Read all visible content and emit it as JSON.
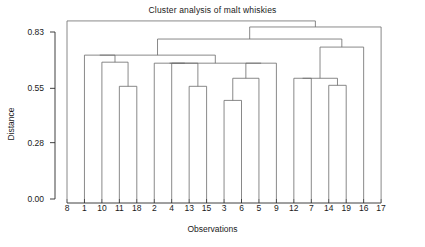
{
  "chart_data": {
    "type": "dendrogram",
    "title": "Cluster analysis of malt whiskies",
    "xlabel": "Observations",
    "ylabel": "Distance",
    "ylim": [
      0.0,
      0.93
    ],
    "yticks": [
      0.0,
      0.28,
      0.55,
      0.83
    ],
    "ytick_labels": [
      "0.00",
      "0.28",
      "0.55",
      "0.83"
    ],
    "grid": false,
    "legend": false,
    "leaf_order": [
      "8",
      "1",
      "10",
      "11",
      "18",
      "2",
      "4",
      "13",
      "15",
      "3",
      "6",
      "5",
      "9",
      "12",
      "7",
      "14",
      "19",
      "16",
      "17"
    ],
    "leaf_count": 19,
    "merges": [
      {
        "id": "m1",
        "left": "11",
        "right": "18",
        "height": 0.56
      },
      {
        "id": "m2",
        "left": "10",
        "right": "m1",
        "height": 0.68
      },
      {
        "id": "m3",
        "left": "1",
        "right": "m2",
        "height": 0.715
      },
      {
        "id": "m4",
        "left": "13",
        "right": "15",
        "height": 0.56
      },
      {
        "id": "m5",
        "left": "4",
        "right": "m4",
        "height": 0.675
      },
      {
        "id": "m6",
        "left": "2",
        "right": "m5",
        "height": 0.675
      },
      {
        "id": "m7",
        "left": "3",
        "right": "6",
        "height": 0.49
      },
      {
        "id": "m8",
        "left": "m7",
        "right": "5",
        "height": 0.6
      },
      {
        "id": "m9",
        "left": "m8",
        "right": "9",
        "height": 0.675
      },
      {
        "id": "m10",
        "left": "14",
        "right": "19",
        "height": 0.565
      },
      {
        "id": "m11",
        "left": "12",
        "right": "7",
        "height": 0.6
      },
      {
        "id": "m12",
        "left": "m11",
        "right": "m10",
        "height": 0.6
      },
      {
        "id": "m13",
        "left": "m6",
        "right": "m9",
        "height": 0.675
      },
      {
        "id": "m14",
        "left": "m3",
        "right": "m13",
        "height": 0.715
      },
      {
        "id": "m15",
        "left": "m12",
        "right": "16",
        "height": 0.755
      },
      {
        "id": "m16",
        "left": "m14",
        "right": "m15",
        "height": 0.795
      },
      {
        "id": "m17",
        "left": "m16",
        "right": "17",
        "height": 0.855
      },
      {
        "id": "m18",
        "left": "8",
        "right": "m17",
        "height": 0.885
      }
    ]
  },
  "axes": {
    "y_tick_labels": [
      "0.83",
      "0.55",
      "0.28",
      "0.00"
    ],
    "x_tick_labels": [
      "8",
      "1",
      "10",
      "11",
      "18",
      "2",
      "4",
      "13",
      "15",
      "3",
      "6",
      "5",
      "9",
      "12",
      "7",
      "14",
      "19",
      "16",
      "17"
    ]
  },
  "colors": {
    "line": "#6b6b6b",
    "axis": "#2a2a2a",
    "text": "#1a1a1a",
    "background": "#ffffff"
  }
}
